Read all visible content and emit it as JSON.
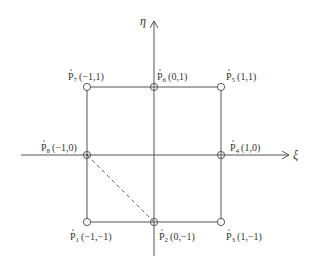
{
  "diagram": {
    "type": "serendipity-element-local-coordinates",
    "axes": {
      "horizontal": {
        "label": "ξ",
        "direction": "right"
      },
      "vertical": {
        "label": "η",
        "direction": "up"
      }
    },
    "nodes": [
      {
        "id": "P1",
        "name": "P",
        "sub": "1",
        "coords": "(−1,−1)",
        "xi": -1,
        "eta": -1
      },
      {
        "id": "P2",
        "name": "P",
        "sub": "2",
        "coords": "(0,−1)",
        "xi": 0,
        "eta": -1
      },
      {
        "id": "P3",
        "name": "P",
        "sub": "3",
        "coords": "(1,−1)",
        "xi": 1,
        "eta": -1
      },
      {
        "id": "P4",
        "name": "P",
        "sub": "4",
        "coords": "(1,0)",
        "xi": 1,
        "eta": 0
      },
      {
        "id": "P5",
        "name": "P",
        "sub": "5",
        "coords": "(1,1)",
        "xi": 1,
        "eta": 1
      },
      {
        "id": "P6",
        "name": "P",
        "sub": "6",
        "coords": "(0,1)",
        "xi": 0,
        "eta": 1
      },
      {
        "id": "P7",
        "name": "P",
        "sub": "7",
        "coords": "(−1,1)",
        "xi": -1,
        "eta": 1
      },
      {
        "id": "P8",
        "name": "P",
        "sub": "8",
        "coords": "(−1,0)",
        "xi": -1,
        "eta": 0
      }
    ],
    "dashed_edge": {
      "from": "P8",
      "to": "P2"
    },
    "colors": {
      "line": "#555555",
      "text": "#333333",
      "background": "#ffffff"
    }
  }
}
